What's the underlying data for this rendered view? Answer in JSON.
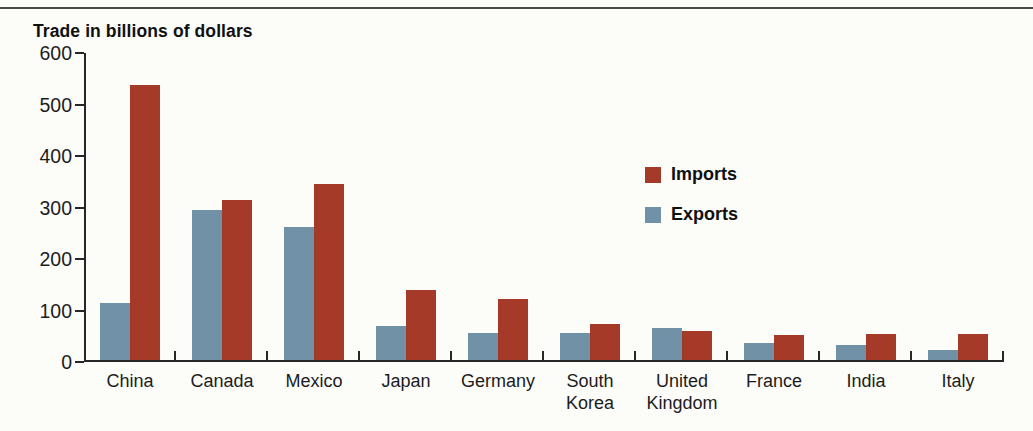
{
  "page": {
    "background_color": "#fcfcf9",
    "top_rule_color": "#4a4a47"
  },
  "chart_data": {
    "type": "bar",
    "title": "Trade in billions of dollars",
    "categories": [
      "China",
      "Canada",
      "Mexico",
      "Japan",
      "Germany",
      "South Korea",
      "United Kingdom",
      "France",
      "India",
      "Italy"
    ],
    "series": [
      {
        "name": "Imports",
        "color": "#a53a28",
        "values": [
          538,
          315,
          345,
          140,
          123,
          73,
          60,
          52,
          54,
          55
        ]
      },
      {
        "name": "Exports",
        "color": "#7191a7",
        "values": [
          114,
          296,
          263,
          70,
          56,
          56,
          66,
          36,
          33,
          23
        ]
      }
    ],
    "pair_order": [
      "Exports",
      "Imports"
    ],
    "ylim": [
      0,
      600
    ],
    "yticks": [
      0,
      100,
      200,
      300,
      400,
      500,
      600
    ],
    "xlabel": "",
    "ylabel": "",
    "legend": {
      "entries": [
        "Imports",
        "Exports"
      ],
      "position": "inside-center-right"
    },
    "grid": false,
    "axis_color": "#272727",
    "text_color": "#1c1c1c"
  }
}
